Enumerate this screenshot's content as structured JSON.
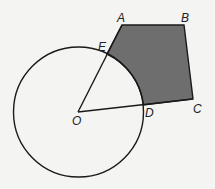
{
  "diagram": {
    "type": "geometry",
    "colors": {
      "background": "#f4f4f2",
      "stroke": "#1a1a1a",
      "fill": "#6e6e6e"
    },
    "circle": {
      "center_label": "O",
      "cx": 78.5,
      "cy": 112,
      "r": 65
    },
    "points": {
      "A": {
        "label": "A",
        "x": 122,
        "y": 25
      },
      "B": {
        "label": "B",
        "x": 184,
        "y": 25
      },
      "C": {
        "label": "C",
        "x": 193,
        "y": 99
      },
      "D": {
        "label": "D",
        "x": 143.5,
        "y": 105
      },
      "E": {
        "label": "E",
        "x": 107,
        "y": 54
      },
      "O": {
        "label": "O",
        "x": 78,
        "y": 112
      }
    }
  }
}
